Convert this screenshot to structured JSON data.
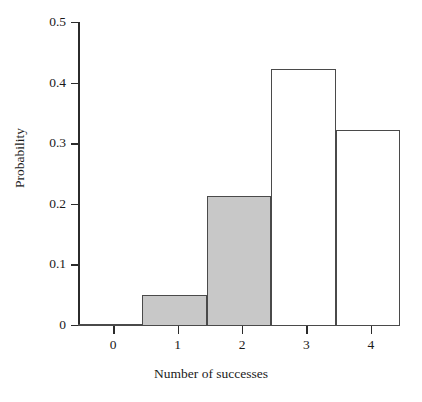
{
  "chart_data": {
    "type": "bar",
    "title": "",
    "subtitle": "",
    "xlabel": "Number of successes",
    "ylabel": "Probability",
    "categories": [
      "0",
      "1",
      "2",
      "3",
      "4"
    ],
    "values": [
      0.002,
      0.05,
      0.214,
      0.423,
      0.322
    ],
    "series": [
      {
        "name": "Probability",
        "values": [
          0.002,
          0.05,
          0.214,
          0.423,
          0.322
        ]
      }
    ],
    "bar_styles": [
      "filled",
      "filled",
      "filled",
      "hollow",
      "hollow"
    ],
    "xlim": [
      -0.5,
      4.5
    ],
    "ylim": [
      0,
      0.5
    ],
    "yticks": [
      0,
      0.1,
      0.2,
      0.3,
      0.4,
      0.5
    ],
    "ytick_labels": [
      "0",
      "0.1",
      "0.2",
      "0.3",
      "0.4",
      "0.5"
    ],
    "xticks": [
      0,
      1,
      2,
      3,
      4
    ],
    "xtick_labels": [
      "0",
      "1",
      "2",
      "3",
      "4"
    ],
    "grid": false,
    "legend": "none",
    "colors": {
      "fill_shaded": "#c8c8c8",
      "fill_hollow": "#ffffff",
      "bar_outline": "#4a4a4a",
      "axis": "#2b2b2b",
      "text": "#1a1a1a",
      "background": "#ffffff"
    }
  },
  "axes": {
    "y_tick_labels": [
      "0.5",
      "0.4",
      "0.3",
      "0.2",
      "0.1",
      "0"
    ],
    "x_tick_labels": [
      "0",
      "1",
      "2",
      "3",
      "4"
    ],
    "y_axis_title": "Probability",
    "x_axis_title": "Number of successes"
  }
}
